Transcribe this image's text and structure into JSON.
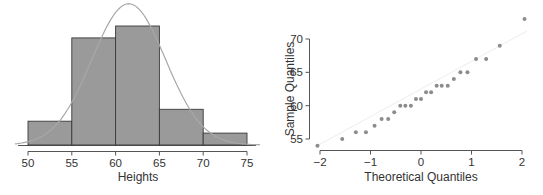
{
  "chart_data": [
    {
      "type": "bar",
      "subtype": "histogram",
      "title": "",
      "xlabel": "Heights",
      "ylabel": "",
      "bins": [
        [
          50,
          55
        ],
        [
          55,
          60
        ],
        [
          60,
          65
        ],
        [
          65,
          70
        ],
        [
          70,
          75
        ]
      ],
      "categories": [
        "50-55",
        "55-60",
        "60-65",
        "65-70",
        "70-75"
      ],
      "values": [
        2,
        9,
        10,
        3,
        1
      ],
      "xticks": [
        "50",
        "55",
        "60",
        "65",
        "70",
        "75"
      ],
      "xlim": [
        49,
        76
      ],
      "overlay": "normal density curve",
      "y_axis_shown": false,
      "grid": false,
      "colors": {
        "bar_fill": "#9a9a9a",
        "bar_edge": "#3a3a3a",
        "curve": "#a8a8a8"
      }
    },
    {
      "type": "scatter",
      "subtype": "normal-qq",
      "title": "",
      "xlabel": "Theoretical Quantiles",
      "ylabel": "Sample Quantiles",
      "xticks": [
        "−2",
        "−1",
        "0",
        "1",
        "2"
      ],
      "yticks": [
        "55",
        "60",
        "65",
        "70"
      ],
      "xlim": [
        -2.1,
        2.1
      ],
      "ylim": [
        53.5,
        73.5
      ],
      "points": [
        [
          -2.05,
          54
        ],
        [
          -1.56,
          55
        ],
        [
          -1.29,
          56
        ],
        [
          -1.09,
          56
        ],
        [
          -0.92,
          57
        ],
        [
          -0.78,
          58
        ],
        [
          -0.65,
          58
        ],
        [
          -0.53,
          59
        ],
        [
          -0.41,
          60
        ],
        [
          -0.31,
          60
        ],
        [
          -0.2,
          60
        ],
        [
          -0.1,
          61
        ],
        [
          0.0,
          61
        ],
        [
          0.1,
          62
        ],
        [
          0.2,
          62
        ],
        [
          0.31,
          63
        ],
        [
          0.41,
          63
        ],
        [
          0.53,
          63
        ],
        [
          0.65,
          64
        ],
        [
          0.78,
          65
        ],
        [
          0.92,
          65
        ],
        [
          1.09,
          67
        ],
        [
          1.29,
          67
        ],
        [
          1.56,
          69
        ],
        [
          2.05,
          73
        ]
      ],
      "reference_line": {
        "from": [
          -2.1,
          53.8
        ],
        "to": [
          2.1,
          71.2
        ]
      },
      "grid": false,
      "colors": {
        "point": "#8c8c8c",
        "axis": "#555555"
      }
    }
  ],
  "histogram": {
    "xlabel": "Heights",
    "xticks": [
      "50",
      "55",
      "60",
      "65",
      "70",
      "75"
    ]
  },
  "qqplot": {
    "xlabel": "Theoretical Quantiles",
    "ylabel": "Sample Quantiles",
    "xticks": [
      "−2",
      "−1",
      "0",
      "1",
      "2"
    ],
    "yticks": [
      "55",
      "60",
      "65",
      "70"
    ]
  }
}
